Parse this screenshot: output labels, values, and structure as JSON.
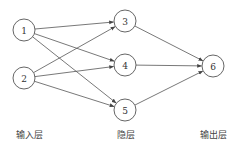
{
  "diagram": {
    "type": "neural-network",
    "nodes": [
      {
        "id": "1",
        "label": "1",
        "layer": "input",
        "x": 24,
        "y": 30
      },
      {
        "id": "2",
        "label": "2",
        "layer": "input",
        "x": 24,
        "y": 78
      },
      {
        "id": "3",
        "label": "3",
        "layer": "hidden",
        "x": 125,
        "y": 21
      },
      {
        "id": "4",
        "label": "4",
        "layer": "hidden",
        "x": 125,
        "y": 65
      },
      {
        "id": "5",
        "label": "5",
        "layer": "hidden",
        "x": 125,
        "y": 110
      },
      {
        "id": "6",
        "label": "6",
        "layer": "output",
        "x": 213,
        "y": 66
      }
    ],
    "edges": [
      {
        "from": "1",
        "to": "3"
      },
      {
        "from": "1",
        "to": "4"
      },
      {
        "from": "1",
        "to": "5"
      },
      {
        "from": "2",
        "to": "3"
      },
      {
        "from": "2",
        "to": "4"
      },
      {
        "from": "2",
        "to": "5"
      },
      {
        "from": "3",
        "to": "6"
      },
      {
        "from": "4",
        "to": "6"
      },
      {
        "from": "5",
        "to": "6"
      }
    ],
    "node_radius": 11,
    "layers": [
      {
        "id": "input",
        "label": "输入层",
        "x": 29,
        "y": 138
      },
      {
        "id": "hidden",
        "label": "隐层",
        "x": 126,
        "y": 138
      },
      {
        "id": "output",
        "label": "输出层",
        "x": 213,
        "y": 138
      }
    ],
    "colors": {
      "stroke": "#555555",
      "text": "#333333",
      "background": "#ffffff"
    }
  }
}
